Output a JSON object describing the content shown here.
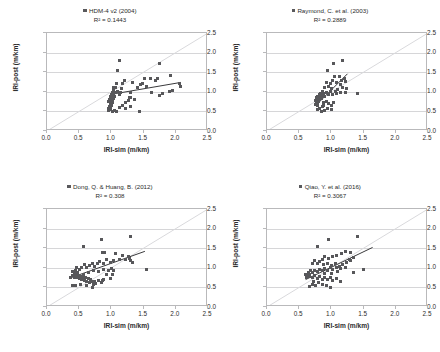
{
  "figure": {
    "panel_count": 4,
    "marker_color": "#57575a",
    "trend_color": "#3a3a3c",
    "diagonal_color": "#d9d9dc",
    "grid_color": "#d6d6d8",
    "axis_color": "#b9b9bb"
  },
  "axes": {
    "xlabel": "IRI-sim (m/km)",
    "ylabel": "IRI-post (m/km)",
    "xticks": [
      "0.0",
      "0.5",
      "1.0",
      "1.5",
      "2.0",
      "2.5"
    ],
    "yticks": [
      "0.0",
      "0.5",
      "1.0",
      "1.5",
      "2.0",
      "2.5"
    ],
    "xlim": [
      0.0,
      2.5
    ],
    "ylim": [
      0.0,
      2.5
    ]
  },
  "chart_data": [
    {
      "type": "scatter",
      "title": "HDM-4 v2 (2004)",
      "r2_label": "R² = 0.1443",
      "r2": 0.1443,
      "xlabel": "IRI-sim (m/km)",
      "ylabel": "IRI-post (m/km)",
      "xlim": [
        0.0,
        2.5
      ],
      "ylim": [
        0.0,
        2.5
      ],
      "grid": true,
      "legend": "HDM-4 v2 (2004)",
      "legend_position": "top-center",
      "reference_line": {
        "type": "identity",
        "from": [
          0.0,
          0.0
        ],
        "to": [
          2.5,
          2.5
        ]
      },
      "trend_line": {
        "from": [
          0.98,
          0.93
        ],
        "to": [
          2.08,
          1.24
        ]
      },
      "points": [
        [
          1.12,
          1.8
        ],
        [
          1.1,
          1.54
        ],
        [
          1.75,
          1.73
        ],
        [
          1.72,
          1.35
        ],
        [
          1.91,
          1.42
        ],
        [
          1.6,
          1.33
        ],
        [
          1.68,
          1.3
        ],
        [
          2.06,
          1.22
        ],
        [
          2.07,
          1.14
        ],
        [
          1.9,
          1.0
        ],
        [
          1.95,
          1.04
        ],
        [
          1.8,
          0.96
        ],
        [
          1.74,
          0.9
        ],
        [
          1.62,
          0.99
        ],
        [
          1.55,
          1.14
        ],
        [
          1.52,
          1.35
        ],
        [
          1.49,
          1.22
        ],
        [
          1.45,
          1.18
        ],
        [
          1.4,
          1.12
        ],
        [
          1.33,
          1.25
        ],
        [
          1.3,
          0.99
        ],
        [
          1.28,
          0.86
        ],
        [
          1.26,
          0.78
        ],
        [
          1.22,
          0.72
        ],
        [
          1.2,
          1.29
        ],
        [
          1.18,
          1.2
        ],
        [
          1.16,
          1.08
        ],
        [
          1.14,
          0.99
        ],
        [
          1.12,
          0.93
        ],
        [
          1.1,
          1.02
        ],
        [
          1.08,
          1.2
        ],
        [
          1.07,
          1.12
        ],
        [
          1.06,
          0.97
        ],
        [
          1.05,
          0.88
        ],
        [
          1.04,
          0.82
        ],
        [
          1.04,
          1.05
        ],
        [
          1.03,
          0.95
        ],
        [
          1.03,
          1.1
        ],
        [
          1.02,
          0.9
        ],
        [
          1.02,
          0.78
        ],
        [
          1.01,
          0.86
        ],
        [
          1.01,
          0.99
        ],
        [
          1.01,
          0.72
        ],
        [
          1.0,
          0.93
        ],
        [
          1.0,
          0.84
        ],
        [
          1.0,
          0.66
        ],
        [
          0.99,
          0.77
        ],
        [
          0.99,
          0.88
        ],
        [
          0.99,
          0.6
        ],
        [
          0.98,
          0.7
        ],
        [
          0.98,
          0.55
        ],
        [
          0.97,
          0.8
        ],
        [
          0.97,
          0.63
        ],
        [
          0.96,
          0.52
        ],
        [
          0.96,
          0.74
        ],
        [
          0.95,
          0.58
        ],
        [
          1.02,
          0.51
        ],
        [
          1.05,
          0.53
        ],
        [
          1.08,
          0.51
        ],
        [
          1.12,
          0.6
        ],
        [
          1.22,
          0.58
        ],
        [
          1.3,
          0.62
        ],
        [
          1.44,
          0.5
        ],
        [
          1.36,
          0.8
        ],
        [
          1.3,
          0.85
        ],
        [
          1.18,
          0.66
        ]
      ]
    },
    {
      "type": "scatter",
      "title": "Raymond, C. et al. (2003)",
      "r2_label": "R² = 0.2889",
      "r2": 0.2889,
      "xlabel": "IRI-sim (m/km)",
      "ylabel": "IRI-post (m/km)",
      "xlim": [
        0.0,
        2.5
      ],
      "ylim": [
        0.0,
        2.5
      ],
      "grid": true,
      "legend": "Raymond, C. et al. (2003)",
      "legend_position": "top-center",
      "reference_line": {
        "type": "identity",
        "from": [
          0.0,
          0.0
        ],
        "to": [
          2.5,
          2.5
        ]
      },
      "trend_line": {
        "from": [
          0.8,
          0.72
        ],
        "to": [
          1.25,
          1.46
        ]
      },
      "points": [
        [
          1.18,
          1.8
        ],
        [
          1.04,
          1.72
        ],
        [
          0.94,
          1.54
        ],
        [
          1.05,
          1.4
        ],
        [
          1.12,
          1.38
        ],
        [
          1.16,
          1.3
        ],
        [
          1.2,
          1.34
        ],
        [
          1.22,
          1.26
        ],
        [
          1.14,
          1.18
        ],
        [
          1.08,
          1.24
        ],
        [
          1.02,
          1.3
        ],
        [
          0.98,
          1.22
        ],
        [
          0.95,
          1.14
        ],
        [
          0.92,
          1.25
        ],
        [
          0.9,
          1.1
        ],
        [
          1.0,
          1.08
        ],
        [
          1.06,
          1.02
        ],
        [
          1.1,
          1.06
        ],
        [
          1.18,
          1.12
        ],
        [
          1.24,
          1.08
        ],
        [
          1.4,
          0.96
        ],
        [
          1.22,
          0.99
        ],
        [
          1.14,
          0.98
        ],
        [
          1.08,
          0.96
        ],
        [
          1.02,
          0.94
        ],
        [
          0.98,
          1.0
        ],
        [
          0.95,
          0.92
        ],
        [
          0.92,
          0.98
        ],
        [
          0.9,
          0.88
        ],
        [
          0.88,
          0.95
        ],
        [
          0.86,
          1.02
        ],
        [
          0.85,
          0.9
        ],
        [
          0.84,
          0.84
        ],
        [
          0.83,
          0.96
        ],
        [
          0.82,
          0.8
        ],
        [
          0.82,
          0.88
        ],
        [
          0.81,
          0.92
        ],
        [
          0.8,
          0.76
        ],
        [
          0.8,
          0.84
        ],
        [
          0.79,
          0.7
        ],
        [
          0.79,
          0.88
        ],
        [
          0.78,
          0.8
        ],
        [
          0.78,
          0.64
        ],
        [
          0.77,
          0.74
        ],
        [
          0.77,
          0.86
        ],
        [
          0.76,
          0.68
        ],
        [
          0.76,
          0.78
        ],
        [
          0.88,
          0.72
        ],
        [
          0.92,
          0.76
        ],
        [
          0.96,
          0.7
        ],
        [
          1.0,
          0.66
        ],
        [
          1.04,
          0.72
        ],
        [
          0.86,
          0.62
        ],
        [
          0.82,
          0.58
        ],
        [
          0.78,
          0.54
        ],
        [
          0.84,
          0.5
        ],
        [
          0.9,
          0.52
        ],
        [
          0.94,
          0.58
        ],
        [
          1.0,
          0.56
        ],
        [
          0.88,
          0.66
        ]
      ]
    },
    {
      "type": "scatter",
      "title": "Dong, Q. & Huang, B. (2012)",
      "r2_label": "R² = 0.308",
      "r2": 0.308,
      "xlabel": "IRI-sim (m/km)",
      "ylabel": "IRI-post (m/km)",
      "xlim": [
        0.0,
        2.5
      ],
      "ylim": [
        0.0,
        2.5
      ],
      "grid": true,
      "legend": "Dong, Q. & Huang, B. (2012)",
      "legend_position": "top-center",
      "reference_line": {
        "type": "identity",
        "from": [
          0.0,
          0.0
        ],
        "to": [
          2.5,
          2.5
        ]
      },
      "trend_line": {
        "from": [
          0.36,
          0.74
        ],
        "to": [
          1.52,
          1.42
        ]
      },
      "points": [
        [
          1.3,
          1.8
        ],
        [
          0.84,
          1.72
        ],
        [
          0.56,
          1.54
        ],
        [
          0.86,
          1.4
        ],
        [
          0.9,
          1.38
        ],
        [
          1.06,
          1.36
        ],
        [
          1.18,
          1.32
        ],
        [
          1.26,
          1.3
        ],
        [
          1.28,
          1.24
        ],
        [
          1.3,
          1.18
        ],
        [
          1.32,
          1.14
        ],
        [
          1.22,
          1.2
        ],
        [
          1.12,
          1.22
        ],
        [
          1.04,
          1.18
        ],
        [
          0.98,
          1.14
        ],
        [
          0.92,
          1.2
        ],
        [
          0.88,
          1.12
        ],
        [
          0.82,
          1.16
        ],
        [
          0.78,
          1.1
        ],
        [
          0.74,
          1.04
        ],
        [
          0.7,
          1.12
        ],
        [
          0.66,
          1.06
        ],
        [
          0.62,
          1.02
        ],
        [
          0.58,
          1.08
        ],
        [
          0.54,
          1.0
        ],
        [
          0.5,
          0.96
        ],
        [
          0.46,
          1.0
        ],
        [
          0.44,
          0.92
        ],
        [
          0.42,
          0.86
        ],
        [
          0.4,
          0.9
        ],
        [
          0.4,
          0.8
        ],
        [
          0.42,
          0.76
        ],
        [
          0.44,
          0.82
        ],
        [
          0.46,
          0.74
        ],
        [
          0.48,
          0.8
        ],
        [
          0.5,
          0.72
        ],
        [
          0.52,
          0.78
        ],
        [
          0.54,
          0.7
        ],
        [
          0.56,
          0.76
        ],
        [
          0.58,
          0.68
        ],
        [
          0.6,
          0.74
        ],
        [
          0.62,
          0.66
        ],
        [
          0.64,
          0.72
        ],
        [
          0.66,
          0.62
        ],
        [
          0.68,
          0.7
        ],
        [
          0.7,
          0.64
        ],
        [
          0.72,
          0.58
        ],
        [
          0.74,
          0.66
        ],
        [
          0.76,
          0.6
        ],
        [
          0.8,
          0.68
        ],
        [
          0.84,
          0.62
        ],
        [
          0.88,
          0.7
        ],
        [
          0.92,
          0.84
        ],
        [
          0.96,
          0.94
        ],
        [
          1.0,
          0.98
        ],
        [
          1.04,
          0.92
        ],
        [
          0.88,
          0.96
        ],
        [
          0.8,
          0.9
        ],
        [
          0.72,
          0.94
        ],
        [
          0.64,
          0.88
        ],
        [
          0.56,
          0.84
        ],
        [
          0.48,
          0.88
        ],
        [
          0.4,
          0.56
        ],
        [
          0.44,
          0.54
        ],
        [
          0.52,
          0.58
        ],
        [
          0.7,
          0.5
        ],
        [
          0.62,
          0.54
        ],
        [
          0.86,
          0.68
        ],
        [
          0.98,
          0.72
        ],
        [
          1.54,
          0.96
        ],
        [
          1.02,
          0.82
        ],
        [
          0.36,
          0.74
        ]
      ]
    },
    {
      "type": "scatter",
      "title": "Qiao, Y. et al. (2016)",
      "r2_label": "R² = 0.3067",
      "r2": 0.3067,
      "xlabel": "IRI-sim (m/km)",
      "ylabel": "IRI-post (m/km)",
      "xlim": [
        0.0,
        2.5
      ],
      "ylim": [
        0.0,
        2.5
      ],
      "grid": true,
      "legend": "Qiao, Y. et al. (2016)",
      "legend_position": "top-center",
      "reference_line": {
        "type": "identity",
        "from": [
          0.0,
          0.0
        ],
        "to": [
          2.5,
          2.5
        ]
      },
      "trend_line": {
        "from": [
          0.6,
          0.7
        ],
        "to": [
          1.64,
          1.52
        ]
      },
      "points": [
        [
          1.4,
          1.8
        ],
        [
          0.96,
          1.72
        ],
        [
          0.78,
          1.54
        ],
        [
          1.22,
          1.42
        ],
        [
          1.3,
          1.4
        ],
        [
          1.16,
          1.36
        ],
        [
          1.08,
          1.32
        ],
        [
          1.02,
          1.28
        ],
        [
          0.96,
          1.24
        ],
        [
          0.9,
          1.3
        ],
        [
          0.86,
          1.22
        ],
        [
          0.82,
          1.16
        ],
        [
          0.78,
          1.12
        ],
        [
          0.74,
          1.18
        ],
        [
          0.7,
          1.1
        ],
        [
          0.88,
          1.08
        ],
        [
          0.94,
          1.12
        ],
        [
          1.0,
          1.06
        ],
        [
          1.06,
          1.1
        ],
        [
          1.12,
          1.04
        ],
        [
          1.18,
          1.08
        ],
        [
          1.24,
          1.14
        ],
        [
          1.28,
          1.22
        ],
        [
          1.3,
          1.18
        ],
        [
          1.34,
          1.26
        ],
        [
          1.22,
          1.0
        ],
        [
          1.14,
          0.98
        ],
        [
          1.08,
          1.0
        ],
        [
          1.02,
          0.96
        ],
        [
          0.98,
          1.0
        ],
        [
          0.94,
          0.94
        ],
        [
          0.9,
          0.98
        ],
        [
          0.86,
          0.92
        ],
        [
          0.82,
          0.96
        ],
        [
          0.78,
          0.9
        ],
        [
          0.74,
          0.94
        ],
        [
          0.7,
          0.88
        ],
        [
          0.68,
          0.92
        ],
        [
          0.66,
          0.84
        ],
        [
          0.64,
          0.88
        ],
        [
          0.62,
          0.8
        ],
        [
          0.6,
          0.84
        ],
        [
          0.62,
          0.76
        ],
        [
          0.66,
          0.78
        ],
        [
          0.7,
          0.74
        ],
        [
          0.74,
          0.8
        ],
        [
          0.78,
          0.72
        ],
        [
          0.82,
          0.78
        ],
        [
          0.86,
          0.7
        ],
        [
          0.9,
          0.76
        ],
        [
          0.94,
          0.7
        ],
        [
          0.98,
          0.74
        ],
        [
          1.02,
          0.68
        ],
        [
          1.08,
          0.72
        ],
        [
          1.14,
          0.66
        ],
        [
          0.8,
          0.62
        ],
        [
          0.86,
          0.58
        ],
        [
          0.92,
          0.54
        ],
        [
          0.98,
          0.5
        ],
        [
          0.76,
          0.54
        ],
        [
          0.7,
          0.58
        ],
        [
          0.66,
          0.52
        ],
        [
          0.72,
          0.66
        ],
        [
          1.5,
          0.96
        ],
        [
          1.34,
          0.88
        ],
        [
          0.9,
          0.86
        ],
        [
          1.0,
          0.86
        ],
        [
          1.1,
          0.9
        ]
      ]
    }
  ]
}
